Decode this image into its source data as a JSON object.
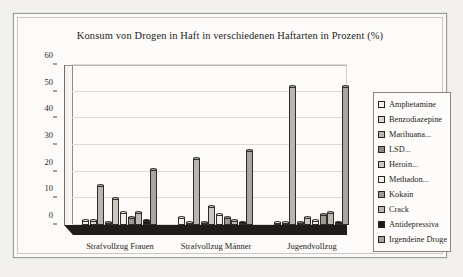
{
  "chart_data": {
    "type": "bar",
    "title": "Konsum von Drogen in Haft in verschiedenen Haftarten in Prozent (%)",
    "xlabel": "",
    "ylabel": "",
    "ylim": [
      0,
      60
    ],
    "yticks": [
      0,
      10,
      20,
      30,
      40,
      50,
      60
    ],
    "grid": true,
    "legend_position": "right",
    "categories": [
      "Strafvollzug Frauen",
      "Strafvollzug Männer",
      "Jugendvollzug"
    ],
    "series": [
      {
        "name": "Amphetamine",
        "color": "#f3f1ed",
        "values": [
          2,
          3,
          1
        ]
      },
      {
        "name": "Benzodiazepine",
        "color": "#d9d6d0",
        "values": [
          2,
          1,
          1
        ]
      },
      {
        "name": "Marihuana...",
        "color": "#b9b6b0",
        "values": [
          15,
          25,
          52
        ]
      },
      {
        "name": "LSD...",
        "color": "#8e8b85",
        "values": [
          1,
          1,
          1
        ]
      },
      {
        "name": "Heroin...",
        "color": "#cbc8c2",
        "values": [
          10,
          7,
          3
        ]
      },
      {
        "name": "Methadon...",
        "color": "#efedE8",
        "values": [
          5,
          4,
          2
        ]
      },
      {
        "name": "Kokain",
        "color": "#9d9a94",
        "values": [
          3,
          3,
          4
        ]
      },
      {
        "name": "Crack",
        "color": "#bcb9b3",
        "values": [
          5,
          2,
          5
        ]
      },
      {
        "name": "Antidepressiva",
        "color": "#1a1916",
        "values": [
          2,
          1,
          1
        ]
      },
      {
        "name": "Irgendeine Droge",
        "color": "#a8a59f",
        "values": [
          21,
          28,
          52
        ]
      }
    ]
  }
}
